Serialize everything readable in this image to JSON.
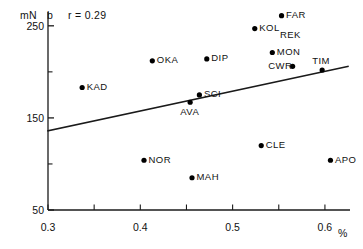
{
  "chart_data": {
    "type": "scatter",
    "title": "",
    "panel_label": "b",
    "annotation": "r = 0.29",
    "correlation": 0.29,
    "xlabel": "%",
    "ylabel": "mN",
    "xlim": [
      0.3,
      0.625
    ],
    "ylim": [
      50,
      265
    ],
    "grid": false,
    "legend": "none",
    "x_ticks_major": [
      "0.3",
      "0.4",
      "0.5",
      "0.6"
    ],
    "x_tick_values_major": [
      0.3,
      0.4,
      0.5,
      0.6
    ],
    "x_tick_values_minor": [
      0.35,
      0.45,
      0.55
    ],
    "y_ticks_major": [
      "250",
      "150",
      "50"
    ],
    "y_tick_values_major": [
      250,
      150,
      50
    ],
    "y_tick_values_minor": [
      200,
      100
    ],
    "points": [
      {
        "label": "KAD",
        "x": 0.337,
        "y": 183,
        "label_pos": "right"
      },
      {
        "label": "OKA",
        "x": 0.413,
        "y": 212,
        "label_pos": "right"
      },
      {
        "label": "DIP",
        "x": 0.472,
        "y": 214,
        "label_pos": "right"
      },
      {
        "label": "AVA",
        "x": 0.454,
        "y": 167,
        "label_pos": "below"
      },
      {
        "label": "SCI",
        "x": 0.464,
        "y": 175,
        "label_pos": "right"
      },
      {
        "label": "NOR",
        "x": 0.404,
        "y": 104,
        "label_pos": "right"
      },
      {
        "label": "MAH",
        "x": 0.456,
        "y": 85,
        "label_pos": "right"
      },
      {
        "label": "CLE",
        "x": 0.531,
        "y": 120,
        "label_pos": "right"
      },
      {
        "label": "APO",
        "x": 0.606,
        "y": 104,
        "label_pos": "right"
      },
      {
        "label": "KOL",
        "x": 0.524,
        "y": 247,
        "label_pos": "right"
      },
      {
        "label": "FAR",
        "x": 0.553,
        "y": 261,
        "label_pos": "right"
      },
      {
        "label": "REK",
        "x": 0.562,
        "y": 239,
        "label_pos": "none"
      },
      {
        "label": "MON",
        "x": 0.543,
        "y": 221,
        "label_pos": "right"
      },
      {
        "label": "CWR",
        "x": 0.565,
        "y": 206,
        "label_pos": "left"
      },
      {
        "label": "TIM",
        "x": 0.597,
        "y": 202,
        "label_pos": "above"
      }
    ],
    "regression_line": {
      "x_start": 0.3,
      "y_start": 136,
      "x_end": 0.625,
      "y_end": 206
    }
  },
  "axes": {
    "y_unit": "mN",
    "x_unit": "%"
  },
  "colors": {
    "axis": "#1a1a1a",
    "marker": "#000000",
    "line": "#1a1a1a",
    "background": "#ffffff"
  }
}
